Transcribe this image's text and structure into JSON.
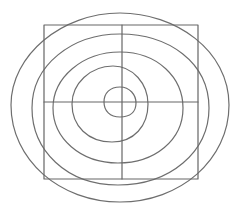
{
  "diagram": {
    "type": "concentric-rings-over-quadrant-grid",
    "background": "#ffffff",
    "stroke_color": "#6e6e6e",
    "frame": {
      "shape": "square",
      "x": 44,
      "y": 25,
      "width": 154,
      "height": 154,
      "stroke_color": "#666666",
      "stroke_width": 1.2
    },
    "crosshair": {
      "vertical_x": 122,
      "horizontal_y": 102,
      "stroke_color": "#666666",
      "stroke_width": 1.2
    },
    "rings": [
      {
        "name": "ring-1-outermost",
        "d": "M 120 13 C 175 13, 229 50, 229 105 C 229 160, 180 202, 120 202 C 60 202, 11 160, 11 105 C 11 55, 62 13, 120 13 Z"
      },
      {
        "name": "ring-2",
        "d": "M 120 34 C 168 34, 209 62, 209 108 C 209 152, 170 185, 118 185 C 66 185, 32 150, 32 108 C 32 65, 72 34, 120 34 Z"
      },
      {
        "name": "ring-3",
        "d": "M 120 52 C 158 52, 183 78, 183 108 C 183 140, 155 163, 118 163 C 80 163, 53 138, 53 108 C 53 78, 82 52, 120 52 Z"
      },
      {
        "name": "ring-4",
        "d": "M 113 66 C 133 66, 148 84, 148 104 C 148 126, 134 142, 112 142 C 88 142, 72 126, 72 104 C 72 84, 90 66, 113 66 Z"
      },
      {
        "name": "ring-5-innermost",
        "d": "M 120 87 C 130 87, 136 95, 136 103 C 136 112, 130 117, 120 117 C 110 117, 104 111, 104 102 C 104 93, 110 87, 120 87 Z"
      }
    ],
    "ring_stroke_width": 1.2
  }
}
